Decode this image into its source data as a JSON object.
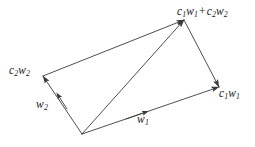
{
  "figure": {
    "type": "vector-parallelogram-diagram",
    "background_color": "#ffffff",
    "line_color": "#3a3a3a",
    "text_color": "#1a1a1a",
    "width": 255,
    "height": 147
  },
  "geometry": {
    "origin": {
      "x": 82,
      "y": 134
    },
    "w1_tip": {
      "x": 219,
      "y": 87
    },
    "w2_tip": {
      "x": 43,
      "y": 76
    },
    "sum_tip": {
      "x": 184,
      "y": 20
    },
    "w1_mid_arrow": {
      "x": 143,
      "y": 112
    },
    "w2_mid_arrow": {
      "x": 60,
      "y": 98
    }
  },
  "labels": {
    "sum": {
      "c1": "c",
      "c1_sub": "1",
      "w1": "w",
      "w1_sub": "1",
      "operator": "+",
      "c2": "c",
      "c2_sub": "2",
      "w2": "w",
      "w2_sub": "2"
    },
    "c2w2": {
      "c": "c",
      "c_sub": "2",
      "w": "w",
      "w_sub": "2"
    },
    "c1w1": {
      "c": "c",
      "c_sub": "1",
      "w": "w",
      "w_sub": "1"
    },
    "w2": {
      "w": "w",
      "w_sub": "2"
    },
    "w1": {
      "w": "w",
      "w_sub": "1"
    }
  }
}
